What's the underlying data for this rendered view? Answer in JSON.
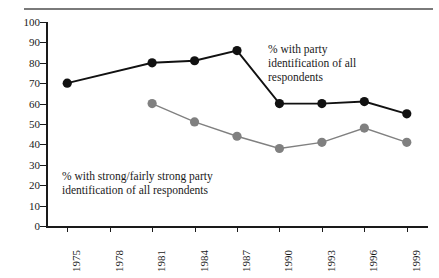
{
  "figure": {
    "title": "",
    "background": "#ffffff"
  },
  "annotations": {
    "party": "% with party\nidentification of all\nrespondents",
    "strong": "% with strong/fairly strong party\nidentification of all respondents"
  },
  "chart_data": {
    "type": "line",
    "title": "",
    "subtitle": "",
    "xlabel": "",
    "ylabel": "",
    "categories": [
      "1975",
      "1978",
      "1981",
      "1984",
      "1987",
      "1990",
      "1993",
      "1996",
      "1999"
    ],
    "x_tick_labels": [
      "1975",
      "1978",
      "1981",
      "1984",
      "1987",
      "1990",
      "1993",
      "1996",
      "1999"
    ],
    "y_tick_labels": [
      "0",
      "10",
      "20",
      "30",
      "40",
      "50",
      "60",
      "70",
      "80",
      "90",
      "100"
    ],
    "y_ticks": [
      0,
      10,
      20,
      30,
      40,
      50,
      60,
      70,
      80,
      90,
      100
    ],
    "ylim": [
      0,
      100
    ],
    "grid": false,
    "legend": "none",
    "legend_position": "inline-annotations",
    "series": [
      {
        "name": "% with party identification of all respondents",
        "color": "#111111",
        "marker": "circle",
        "x": [
          "1975",
          "1981",
          "1984",
          "1987",
          "1990",
          "1993",
          "1996",
          "1999"
        ],
        "values": [
          70,
          80,
          81,
          86,
          60,
          60,
          61,
          55
        ]
      },
      {
        "name": "% with strong/fairly strong party identification of all respondents",
        "color": "#808080",
        "marker": "circle",
        "x": [
          "1981",
          "1984",
          "1987",
          "1990",
          "1993",
          "1996",
          "1999"
        ],
        "values": [
          60,
          51,
          44,
          38,
          41,
          48,
          41
        ]
      }
    ]
  },
  "colors": {
    "series_party": "#111111",
    "series_strong": "#808080",
    "axis": "#1a1a1a",
    "rule": "#7a7a7a"
  }
}
